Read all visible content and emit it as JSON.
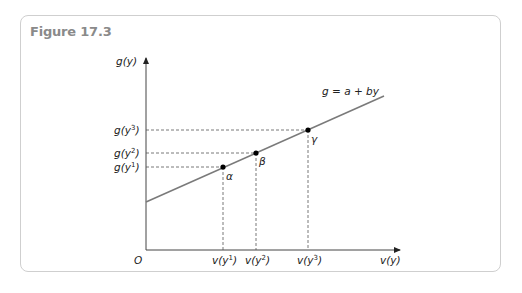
{
  "figure": {
    "title": "Figure 17.3"
  },
  "axes": {
    "y_label": "g(y)",
    "x_label": "v(y)",
    "origin_label": "O"
  },
  "line": {
    "label": "g = a + by"
  },
  "points": [
    {
      "name": "α",
      "x_label_base": "v(y",
      "x_label_sup": "1",
      "y_label_base": "g(y",
      "y_label_sup": "1"
    },
    {
      "name": "β",
      "x_label_base": "v(y",
      "x_label_sup": "2",
      "y_label_base": "g(y",
      "y_label_sup": "2"
    },
    {
      "name": "γ",
      "x_label_base": "v(y",
      "x_label_sup": "3",
      "y_label_base": "g(y",
      "y_label_sup": "3"
    }
  ],
  "colors": {
    "line": "#7a7a7a",
    "axis": "#333333",
    "border": "#cfcfcf",
    "title": "#8a8a8a"
  }
}
